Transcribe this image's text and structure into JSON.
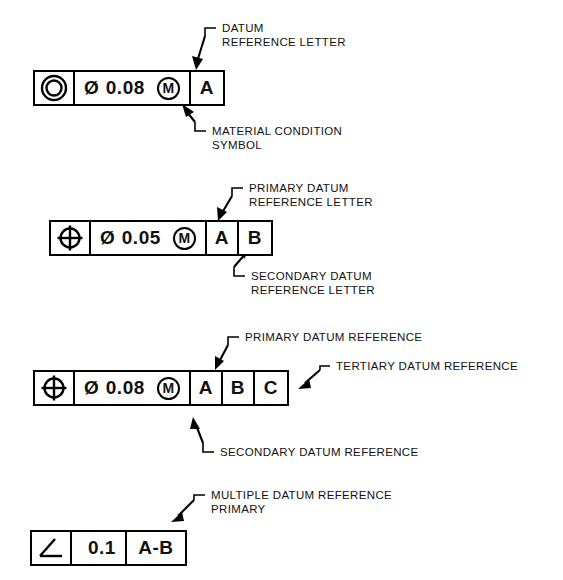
{
  "page": {
    "background": "#ffffff",
    "ink": "#000000"
  },
  "frames": [
    {
      "id": "frame-concentricity",
      "symbol": "concentricity-symbol",
      "diameter_glyph": "Ø",
      "tolerance": "0.08",
      "modifier": "M",
      "datums": [
        "A"
      ]
    },
    {
      "id": "frame-position-two-datum",
      "symbol": "position-symbol",
      "diameter_glyph": "Ø",
      "tolerance": "0.05",
      "modifier": "M",
      "datums": [
        "A",
        "B"
      ]
    },
    {
      "id": "frame-position-three-datum",
      "symbol": "position-symbol",
      "diameter_glyph": "Ø",
      "tolerance": "0.08",
      "modifier": "M",
      "datums": [
        "A",
        "B",
        "C"
      ]
    },
    {
      "id": "frame-angularity",
      "symbol": "angularity-symbol",
      "diameter_glyph": "",
      "tolerance": "0.1",
      "modifier": "",
      "datums": [
        "A-B"
      ]
    }
  ],
  "annotations": {
    "datum_reference_letter": "DATUM\nREFERENCE LETTER",
    "material_condition_symbol": "MATERIAL CONDITION\nSYMBOL",
    "primary_datum_reference_letter": "PRIMARY DATUM\nREFERENCE LETTER",
    "secondary_datum_reference_letter": "SECONDARY DATUM\nREFERENCE LETTER",
    "primary_datum_reference": "PRIMARY DATUM REFERENCE",
    "tertiary_datum_reference": "TERTIARY DATUM REFERENCE",
    "secondary_datum_reference": "SECONDARY DATUM REFERENCE",
    "multiple_datum_reference_primary": "MULTIPLE DATUM REFERENCE\nPRIMARY"
  }
}
